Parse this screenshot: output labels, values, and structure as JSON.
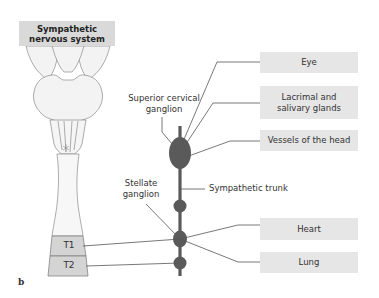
{
  "figure": {
    "title": [
      "Sympathetic",
      "nervous system"
    ],
    "figure_letter": "b"
  },
  "labels": {
    "superior_cervical_ganglion": [
      "Superior cervical",
      "ganglion"
    ],
    "stellate_ganglion": [
      "Stellate",
      "ganglion"
    ],
    "sympathetic_trunk": "Sympathetic trunk"
  },
  "spinal_segments": [
    "T1",
    "T2"
  ],
  "targets": [
    {
      "label": [
        "Eye"
      ]
    },
    {
      "label": [
        "Lacrimal and",
        "salivary glands"
      ]
    },
    {
      "label": [
        "Vessels of the head"
      ]
    },
    {
      "label": [
        "Heart"
      ]
    },
    {
      "label": [
        "Lung"
      ]
    }
  ],
  "colors": {
    "ganglion": "#5a5a5a",
    "trunk": "#5a5a5a",
    "box_fill": "#e6e6e6",
    "title_fill": "#d9d9d9",
    "segment_fill": "#d4d4d4",
    "brain_fill": "#f2f2f2"
  }
}
